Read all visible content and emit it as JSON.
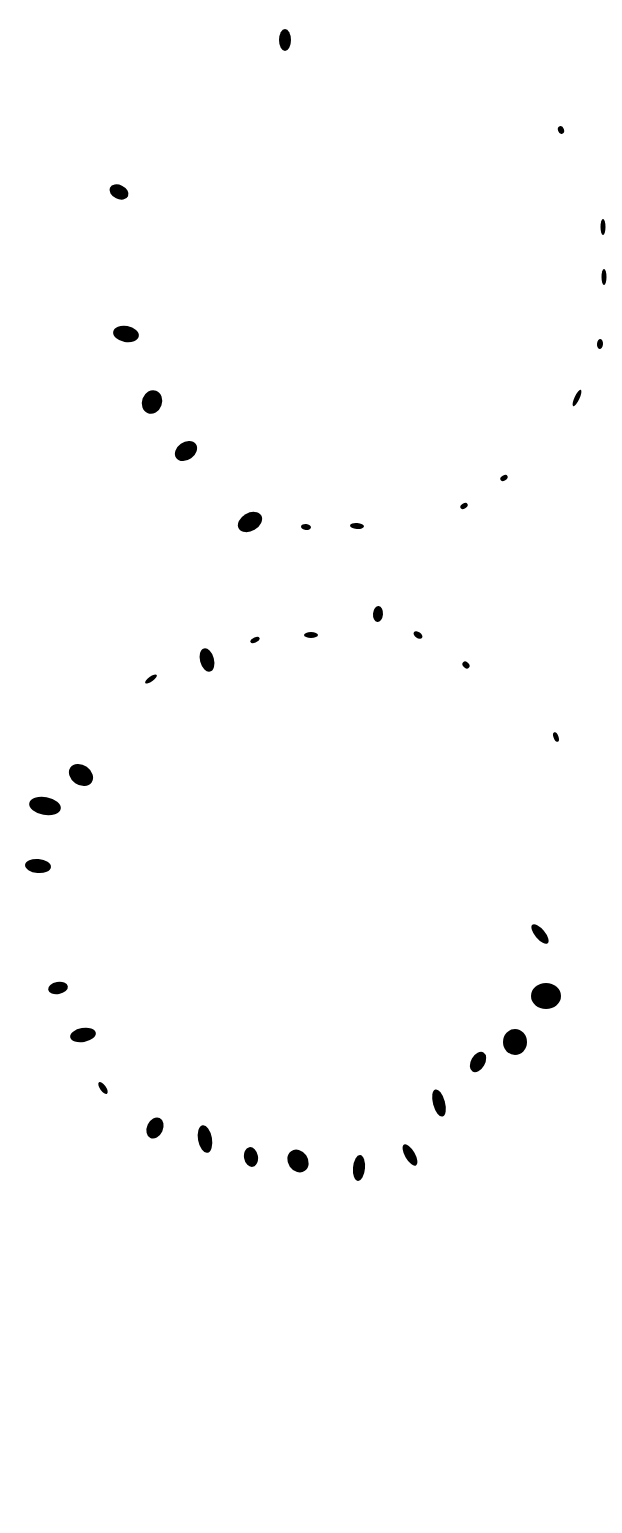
{
  "canvas": {
    "width": 622,
    "height": 1533,
    "background": "#ffffff",
    "ink": "#000000"
  },
  "figure": {
    "upper_loop": [
      {
        "x": 285,
        "y": 40,
        "rx": 6,
        "ry": 11,
        "rot": 0
      },
      {
        "x": 561,
        "y": 130,
        "rx": 3,
        "ry": 4,
        "rot": -20
      },
      {
        "x": 119,
        "y": 192,
        "rx": 10,
        "ry": 7,
        "rot": 25
      },
      {
        "x": 603,
        "y": 227,
        "rx": 2.5,
        "ry": 8,
        "rot": 0
      },
      {
        "x": 604,
        "y": 277,
        "rx": 2.5,
        "ry": 8,
        "rot": 0
      },
      {
        "x": 126,
        "y": 334,
        "rx": 13,
        "ry": 8,
        "rot": 10
      },
      {
        "x": 600,
        "y": 344,
        "rx": 3,
        "ry": 5,
        "rot": 5
      },
      {
        "x": 152,
        "y": 402,
        "rx": 10,
        "ry": 12,
        "rot": 20
      },
      {
        "x": 577,
        "y": 398,
        "rx": 2.5,
        "ry": 9,
        "rot": 25
      },
      {
        "x": 186,
        "y": 451,
        "rx": 12,
        "ry": 9,
        "rot": -35
      },
      {
        "x": 504,
        "y": 478,
        "rx": 4,
        "ry": 2.5,
        "rot": -30
      },
      {
        "x": 464,
        "y": 506,
        "rx": 4,
        "ry": 2.5,
        "rot": -30
      },
      {
        "x": 250,
        "y": 522,
        "rx": 13,
        "ry": 9,
        "rot": -30
      },
      {
        "x": 306,
        "y": 527,
        "rx": 5,
        "ry": 3,
        "rot": 5
      },
      {
        "x": 357,
        "y": 526,
        "rx": 7,
        "ry": 3,
        "rot": 5
      }
    ],
    "lower_loop": [
      {
        "x": 378,
        "y": 614,
        "rx": 5,
        "ry": 8,
        "rot": 5
      },
      {
        "x": 311,
        "y": 635,
        "rx": 7,
        "ry": 3,
        "rot": 0
      },
      {
        "x": 255,
        "y": 640,
        "rx": 5,
        "ry": 2.5,
        "rot": -25
      },
      {
        "x": 418,
        "y": 635,
        "rx": 5,
        "ry": 3,
        "rot": 35
      },
      {
        "x": 207,
        "y": 660,
        "rx": 7,
        "ry": 12,
        "rot": -15
      },
      {
        "x": 466,
        "y": 665,
        "rx": 4,
        "ry": 3,
        "rot": 45
      },
      {
        "x": 151,
        "y": 679,
        "rx": 7,
        "ry": 2.5,
        "rot": -35
      },
      {
        "x": 556,
        "y": 737,
        "rx": 2.5,
        "ry": 5,
        "rot": -20
      },
      {
        "x": 81,
        "y": 775,
        "rx": 13,
        "ry": 10,
        "rot": 35
      },
      {
        "x": 45,
        "y": 806,
        "rx": 16,
        "ry": 9,
        "rot": 10
      },
      {
        "x": 38,
        "y": 866,
        "rx": 13,
        "ry": 7,
        "rot": 5
      },
      {
        "x": 540,
        "y": 934,
        "rx": 5,
        "ry": 12,
        "rot": -40
      },
      {
        "x": 58,
        "y": 988,
        "rx": 10,
        "ry": 6,
        "rot": -10
      },
      {
        "x": 546,
        "y": 996,
        "rx": 15,
        "ry": 13,
        "rot": 0
      },
      {
        "x": 83,
        "y": 1035,
        "rx": 13,
        "ry": 7,
        "rot": -10
      },
      {
        "x": 515,
        "y": 1042,
        "rx": 12,
        "ry": 13,
        "rot": 0
      },
      {
        "x": 478,
        "y": 1062,
        "rx": 7,
        "ry": 11,
        "rot": 30
      },
      {
        "x": 103,
        "y": 1088,
        "rx": 3,
        "ry": 7,
        "rot": -35
      },
      {
        "x": 439,
        "y": 1103,
        "rx": 6,
        "ry": 14,
        "rot": -15
      },
      {
        "x": 155,
        "y": 1128,
        "rx": 8,
        "ry": 11,
        "rot": 25
      },
      {
        "x": 205,
        "y": 1139,
        "rx": 7,
        "ry": 14,
        "rot": -10
      },
      {
        "x": 251,
        "y": 1157,
        "rx": 7,
        "ry": 10,
        "rot": -10
      },
      {
        "x": 298,
        "y": 1161,
        "rx": 10,
        "ry": 12,
        "rot": -35
      },
      {
        "x": 410,
        "y": 1155,
        "rx": 5,
        "ry": 12,
        "rot": -30
      },
      {
        "x": 359,
        "y": 1168,
        "rx": 6,
        "ry": 13,
        "rot": 5
      }
    ]
  }
}
